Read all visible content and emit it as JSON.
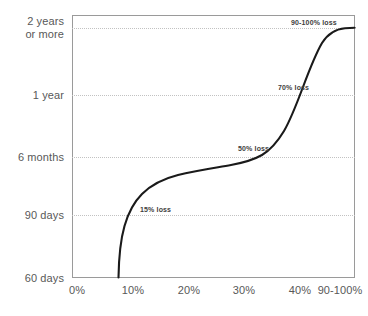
{
  "chart_data": {
    "type": "line",
    "title": "",
    "subtitle": "",
    "xlabel": "",
    "ylabel": "",
    "grid": true,
    "legend": "none",
    "x_tick_labels": [
      "0%",
      "10%",
      "20%",
      "30%",
      "40%",
      "90-100%"
    ],
    "y_tick_labels": [
      "2 years\nor more",
      "1 year",
      "6 months",
      "90 days",
      "60 days"
    ],
    "x_tick_positions_px": [
      77,
      133,
      189,
      244,
      300,
      340
    ],
    "y_tick_positions_px": [
      28,
      95,
      157,
      215,
      278
    ],
    "xlim": [
      "0%",
      "90-100%"
    ],
    "ylim": [
      "60 days",
      "2 years or more"
    ],
    "series": [
      {
        "name": "recovery time vs loss",
        "description": "S-shaped curve rising from 60 days at about 8% loss to 2 years or more at 90-100% loss",
        "points": [
          {
            "x_pct": 8,
            "y_label": "60 days"
          },
          {
            "x_pct": 10,
            "y_label": "75 days"
          },
          {
            "x_pct": 13,
            "y_label": "90 days"
          },
          {
            "x_pct": 20,
            "y_label": "4 months"
          },
          {
            "x_pct": 30,
            "y_label": "5 months"
          },
          {
            "x_pct": 40,
            "y_label": "6 months"
          },
          {
            "x_pct": 50,
            "y_label": "8 months"
          },
          {
            "x_pct": 60,
            "y_label": "1 year"
          },
          {
            "x_pct": 75,
            "y_label": "18 months"
          },
          {
            "x_pct": 95,
            "y_label": "2 years or more"
          }
        ]
      }
    ],
    "annotations": [
      {
        "label": "15% loss",
        "x_px": 140,
        "y_px": 205
      },
      {
        "label": "50% loss",
        "x_px": 238,
        "y_px": 144
      },
      {
        "label": "70% loss",
        "x_px": 278,
        "y_px": 83
      },
      {
        "label": "90-100% loss",
        "x_px": 291,
        "y_px": 18
      }
    ],
    "colors": {
      "curve": "#1a1a1a",
      "frame": "#9a9a9a",
      "grid": "#c2c2c2",
      "tick_text": "#585858",
      "annotation_text": "#3d3d3d",
      "background": "#ffffff"
    }
  }
}
